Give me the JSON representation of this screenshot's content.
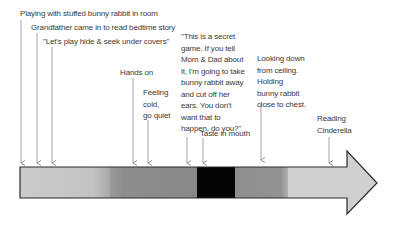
{
  "diagram": {
    "type": "timeline",
    "events": [
      {
        "id": "playing",
        "text": "Playing with stuffed bunny rabbit in room"
      },
      {
        "id": "grandfather",
        "text": "Grandfather came in to read bedtime story"
      },
      {
        "id": "hide-seek",
        "text": "\"Let's play hide & seek under covers\""
      },
      {
        "id": "hands-on",
        "text": "Hands on"
      },
      {
        "id": "feeling-cold",
        "text": "Feeling\ncold,\ngo quiet"
      },
      {
        "id": "secret-quote",
        "text": "\"This is a secret\ngame. If you tell\nMom & Dad about\nit, I'm going to take\nbunny rabbit away\nand cut off her\nears. You don't\nwant that to\nhappen, do you?\""
      },
      {
        "id": "taste",
        "text": "Taste in mouth"
      },
      {
        "id": "looking-down",
        "text": "Looking down\nfrom ceiling.\nHolding\nbunny rabbit\nclose to chest."
      },
      {
        "id": "reading",
        "text": "Reading\nCinderella"
      }
    ],
    "arrow_segments": [
      {
        "name": "light-start",
        "color": "#c8c8c8"
      },
      {
        "name": "gray-middle",
        "color": "#8c8c8c"
      },
      {
        "name": "black-core",
        "color": "#050505"
      },
      {
        "name": "gray-after",
        "color": "#8f8f8f"
      },
      {
        "name": "light-end",
        "color": "#cfcfcf"
      }
    ]
  }
}
